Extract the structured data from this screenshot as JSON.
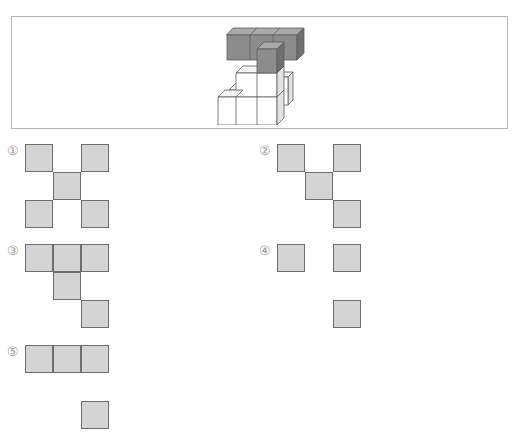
{
  "figure": {
    "colors": {
      "dark_front": "#8c8c8c",
      "dark_top": "#a9a9a9",
      "dark_side": "#6f6f6f",
      "light_front": "#ffffff",
      "light_top": "#f4f4f4",
      "light_side": "#e2e2e2",
      "edge": "#5a5a5a"
    }
  },
  "options": [
    {
      "label": "①",
      "cells": [
        [
          0,
          0
        ],
        [
          0,
          2
        ],
        [
          1,
          1
        ],
        [
          2,
          0
        ],
        [
          2,
          2
        ]
      ]
    },
    {
      "label": "②",
      "cells": [
        [
          0,
          0
        ],
        [
          0,
          2
        ],
        [
          1,
          1
        ],
        [
          2,
          2
        ]
      ]
    },
    {
      "label": "③",
      "cells": [
        [
          0,
          0
        ],
        [
          0,
          1
        ],
        [
          0,
          2
        ],
        [
          1,
          1
        ],
        [
          2,
          2
        ]
      ]
    },
    {
      "label": "④",
      "cells": [
        [
          0,
          0
        ],
        [
          0,
          2
        ],
        [
          2,
          2
        ]
      ]
    },
    {
      "label": "⑤",
      "cells": [
        [
          0,
          0
        ],
        [
          0,
          1
        ],
        [
          0,
          2
        ],
        [
          2,
          2
        ]
      ]
    }
  ],
  "square_color": "#d4d4d4",
  "square_border": "#6e6e6e"
}
